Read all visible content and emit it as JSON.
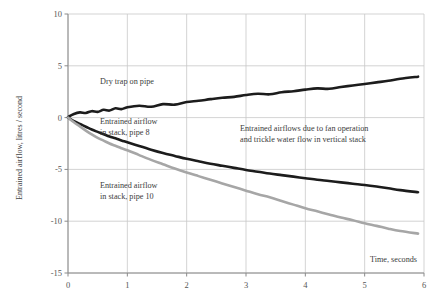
{
  "chart_data": {
    "type": "line",
    "title": "",
    "subtitle": "",
    "xlabel": "Time, seconds",
    "ylabel": "Entrained airflow, litres / second",
    "xlim": [
      0,
      6
    ],
    "ylim": [
      -15,
      10
    ],
    "xticks": [
      "0",
      "1",
      "2",
      "3",
      "4",
      "5",
      "6"
    ],
    "xtick_values": [
      0,
      1,
      2,
      3,
      4,
      5,
      6
    ],
    "yticks": [
      "10",
      "5",
      "0",
      "-5",
      "-10",
      "-15"
    ],
    "ytick_values": [
      10,
      5,
      0,
      -5,
      -10,
      -15
    ],
    "grid": true,
    "grid_color": "#c8c8c8",
    "legend_position": "inline-annotations",
    "x": [
      0,
      0.1,
      0.2,
      0.3,
      0.4,
      0.5,
      0.6,
      0.7,
      0.8,
      0.9,
      1.0,
      1.2,
      1.4,
      1.6,
      1.8,
      2.0,
      2.2,
      2.4,
      2.6,
      2.8,
      3.0,
      3.2,
      3.4,
      3.6,
      3.8,
      4.0,
      4.2,
      4.4,
      4.6,
      4.8,
      5.0,
      5.2,
      5.4,
      5.6,
      5.9
    ],
    "series": [
      {
        "name": "Dry trap on pipe",
        "color": "#1c1c1c",
        "width": 2.6,
        "values": [
          0.05,
          0.35,
          0.5,
          0.45,
          0.62,
          0.55,
          0.75,
          0.68,
          0.9,
          0.82,
          1.0,
          1.15,
          1.05,
          1.3,
          1.25,
          1.5,
          1.62,
          1.78,
          1.92,
          2.0,
          2.18,
          2.3,
          2.25,
          2.45,
          2.55,
          2.7,
          2.82,
          2.78,
          2.95,
          3.1,
          3.25,
          3.4,
          3.55,
          3.75,
          3.95
        ]
      },
      {
        "name": "Entrained airflow in stack, pipe 8",
        "color": "#1c1c1c",
        "width": 2.6,
        "values": [
          0.0,
          -0.35,
          -0.62,
          -0.88,
          -1.15,
          -1.38,
          -1.6,
          -1.82,
          -2.0,
          -2.2,
          -2.38,
          -2.75,
          -3.1,
          -3.42,
          -3.7,
          -3.98,
          -4.22,
          -4.45,
          -4.65,
          -4.85,
          -5.05,
          -5.22,
          -5.4,
          -5.55,
          -5.7,
          -5.85,
          -6.0,
          -6.12,
          -6.25,
          -6.38,
          -6.5,
          -6.65,
          -6.82,
          -7.0,
          -7.2
        ]
      },
      {
        "name": "Entrained airflow in stack, pipe 10",
        "color": "#a6a6a6",
        "width": 2.6,
        "values": [
          0.0,
          -0.45,
          -0.85,
          -1.25,
          -1.62,
          -1.95,
          -2.22,
          -2.5,
          -2.72,
          -2.95,
          -3.15,
          -3.62,
          -4.08,
          -4.5,
          -4.92,
          -5.3,
          -5.65,
          -6.0,
          -6.35,
          -6.7,
          -7.05,
          -7.4,
          -7.7,
          -8.05,
          -8.4,
          -8.75,
          -9.05,
          -9.35,
          -9.65,
          -9.9,
          -10.2,
          -10.45,
          -10.72,
          -10.95,
          -11.2
        ]
      }
    ],
    "annotations": [
      {
        "name": "dry-trap-label",
        "text": "Dry trap on pipe",
        "x": 100,
        "y": 84
      },
      {
        "name": "pipe8-label-line1",
        "text": "Entrained airflow",
        "x": 100,
        "y": 124
      },
      {
        "name": "pipe8-label-line2",
        "text": "in stack, pipe 8",
        "x": 100,
        "y": 135
      },
      {
        "name": "pipe10-label-line1",
        "text": "Entrained airflow",
        "x": 100,
        "y": 188
      },
      {
        "name": "pipe10-label-line2",
        "text": "in stack, pipe 10",
        "x": 100,
        "y": 199
      },
      {
        "name": "fan-operation-note-line1",
        "text": "Entrained airflows due to fan operation",
        "x": 240,
        "y": 131
      },
      {
        "name": "fan-operation-note-line2",
        "text": "and trickle water flow in vertical stack",
        "x": 240,
        "y": 142
      }
    ]
  }
}
